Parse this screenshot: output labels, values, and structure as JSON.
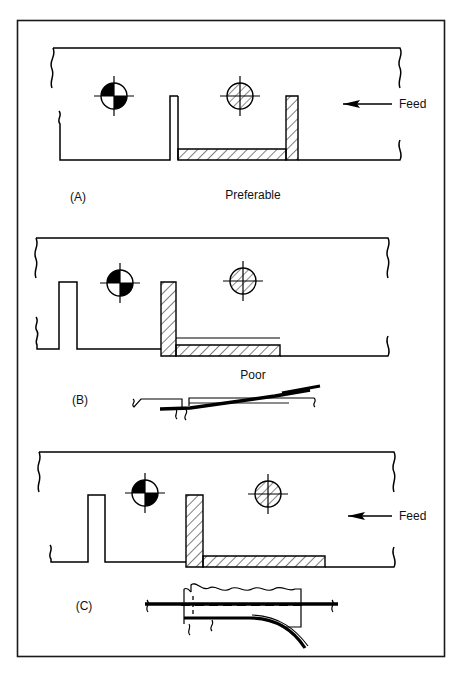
{
  "figure": {
    "border_color": "#1a1a1a",
    "line_color": "#000000",
    "hatch_color": "#000000",
    "background": "#ffffff"
  },
  "panels": [
    {
      "id": "A",
      "label": "(A)",
      "caption": "Preferable",
      "feed_label": "Feed",
      "feed_direction": "left",
      "has_feed_arrow": true,
      "has_detail_sketch": false,
      "symbols": [
        {
          "name": "pilot-pin-solid-quadrant",
          "kind": "quadrant-circle",
          "cx": 114,
          "cy": 96
        },
        {
          "name": "pilot-pin-hatched",
          "kind": "hatched-circle",
          "cx": 240,
          "cy": 96
        }
      ]
    },
    {
      "id": "B",
      "label": "(B)",
      "caption": "Poor",
      "feed_label": "",
      "feed_direction": "",
      "has_feed_arrow": false,
      "has_detail_sketch": true,
      "symbols": [
        {
          "name": "pilot-pin-solid-quadrant",
          "kind": "quadrant-circle",
          "cx": 120,
          "cy": 283
        },
        {
          "name": "pilot-pin-hatched",
          "kind": "hatched-circle",
          "cx": 243,
          "cy": 281
        }
      ]
    },
    {
      "id": "C",
      "label": "(C)",
      "caption": "",
      "feed_label": "Feed",
      "feed_direction": "left",
      "has_feed_arrow": true,
      "has_detail_sketch": true,
      "symbols": [
        {
          "name": "pilot-pin-solid-quadrant",
          "kind": "quadrant-circle",
          "cx": 145,
          "cy": 493
        },
        {
          "name": "pilot-pin-hatched",
          "kind": "hatched-circle",
          "cx": 268,
          "cy": 494
        }
      ]
    }
  ],
  "labels": {
    "panel_a": "(A)",
    "panel_b": "(B)",
    "panel_c": "(C)",
    "caption_a": "Preferable",
    "caption_b": "Poor",
    "feed_a": "Feed",
    "feed_c": "Feed"
  }
}
